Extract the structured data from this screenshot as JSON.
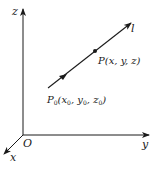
{
  "diagram": {
    "title": "",
    "axes": {
      "z_label": "z",
      "y_label": "y",
      "x_label": "x",
      "origin_label": "O"
    },
    "line": {
      "label": "l",
      "point": {
        "name": "P",
        "coords_text": "(x, y, z)"
      },
      "base_point": {
        "name": "P",
        "subscript": "0",
        "open": "(",
        "x": "x",
        "x_sub": "0",
        "sep1": ", ",
        "y": "y",
        "y_sub": "0",
        "sep2": ", ",
        "z": "z",
        "z_sub": "0",
        "close": ")"
      }
    },
    "colors": {
      "stroke": "#1a1a1a",
      "background": "#ffffff"
    }
  }
}
